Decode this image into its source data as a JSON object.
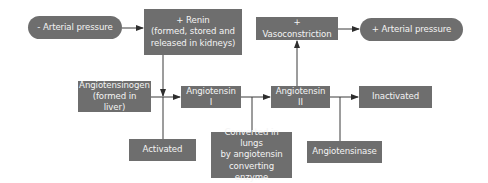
{
  "diagram": {
    "colors": {
      "node_fill": "#6e6e6e",
      "node_text": "#f4f4f4",
      "edge": "#3a3a3a",
      "background": "#ffffff"
    },
    "nodes": {
      "low_pressure": {
        "label": "- Arterial pressure",
        "shape": "pill"
      },
      "renin": {
        "label": "+ Renin (formed, stored and released in kidneys)",
        "lines": [
          "+ Renin",
          "(formed, stored and",
          "released in kidneys)"
        ],
        "shape": "rect"
      },
      "vasoconstriction": {
        "label": "+ Vasoconstriction",
        "shape": "rect"
      },
      "high_pressure": {
        "label": "+ Arterial pressure",
        "shape": "pill"
      },
      "angiotensinogen": {
        "label": "Angiotensinogen (formed in liver)",
        "lines": [
          "Angiotensinogen",
          "(formed in liver)"
        ],
        "shape": "rect"
      },
      "angiotensin1": {
        "label": "Angiotensin I",
        "shape": "rect"
      },
      "angiotensin2": {
        "label": "Angiotensin II",
        "shape": "rect"
      },
      "inactivated": {
        "label": "Inactivated",
        "shape": "rect"
      },
      "activated": {
        "label": "Activated",
        "shape": "rect"
      },
      "converted": {
        "label": "Converted in lungs by angiotensin converting enzyme",
        "lines": [
          "Converted in lungs",
          "by angiotensin",
          "converting enzyme"
        ],
        "shape": "rect"
      },
      "angiotensinase": {
        "label": "Angiotensinase",
        "shape": "rect"
      }
    },
    "edges": [
      {
        "from": "low_pressure",
        "to": "renin"
      },
      {
        "from": "renin",
        "to": "angiotensinogen-junction"
      },
      {
        "from": "angiotensinogen",
        "to": "angiotensin1"
      },
      {
        "from": "activated",
        "to": "angiotensinogen-junction"
      },
      {
        "from": "angiotensin1",
        "to": "angiotensin2"
      },
      {
        "from": "converted",
        "to": "angiotensin1-junction"
      },
      {
        "from": "angiotensin2",
        "to": "vasoconstriction"
      },
      {
        "from": "vasoconstriction",
        "to": "high_pressure"
      },
      {
        "from": "angiotensin2",
        "to": "inactivated"
      },
      {
        "from": "angiotensinase",
        "to": "angiotensin2-junction"
      }
    ]
  }
}
